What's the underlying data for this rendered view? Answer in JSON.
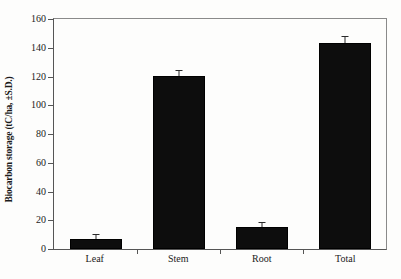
{
  "chart_data": {
    "type": "bar",
    "title": "",
    "xlabel": "",
    "ylabel": "Biocarbon storage (tC/ha, ±S.D.)",
    "categories": [
      "Leaf",
      "Stem",
      "Root",
      "Total"
    ],
    "values": [
      7,
      120.5,
      15,
      143
    ],
    "errors": [
      0.6,
      1.5,
      0.8,
      2.2
    ],
    "ylim": [
      0,
      160
    ],
    "yticks": [
      0,
      20,
      40,
      60,
      80,
      100,
      120,
      140,
      160
    ],
    "ytick_labels": [
      "0",
      "20",
      "40",
      "60",
      "80",
      "100",
      "120",
      "140",
      "160"
    ],
    "grid": false,
    "legend": null,
    "bar_color": "#0d0d0d",
    "error_bar_color": "#2a2a2a",
    "axis_color": "#555555",
    "frame": true
  }
}
